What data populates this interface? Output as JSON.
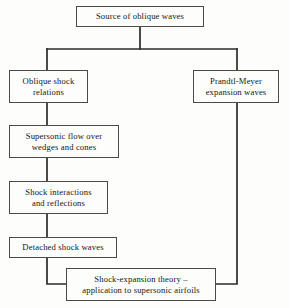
{
  "diagram": {
    "line_color": "#2b2b2b",
    "box_border_color": "#4a4a4a",
    "background_color": "#fdfdfc",
    "text_color": "#151515"
  },
  "nodes": {
    "source": {
      "label": "Source of oblique waves"
    },
    "oblique_shock": {
      "label": "Oblique shock\nrelations"
    },
    "prandtl_meyer": {
      "label": "Prandtl-Meyer\nexpansion waves"
    },
    "supersonic_wedges": {
      "label": "Supersonic flow over\nwedges and cones"
    },
    "shock_interactions": {
      "label": "Shock interactions\nand reflections"
    },
    "detached_shock": {
      "label": "Detached shock waves"
    },
    "shock_expansion": {
      "label": "Shock-expansion theory –\napplication to supersonic airfoils"
    }
  },
  "connectors": [
    {
      "name": "source-to-split",
      "from": "source",
      "to": "split-bar"
    },
    {
      "name": "split-bar-to-oblique-shock",
      "from": "split-bar",
      "to": "oblique_shock"
    },
    {
      "name": "split-bar-to-prandtl-meyer",
      "from": "split-bar",
      "to": "prandtl_meyer"
    },
    {
      "name": "oblique-shock-to-supersonic-wedges",
      "from": "oblique_shock",
      "to": "supersonic_wedges"
    },
    {
      "name": "supersonic-wedges-to-shock-interactions",
      "from": "supersonic_wedges",
      "to": "shock_interactions"
    },
    {
      "name": "shock-interactions-to-detached-shock",
      "from": "shock_interactions",
      "to": "detached_shock"
    },
    {
      "name": "detached-shock-to-shock-expansion",
      "from": "detached_shock",
      "to": "shock_expansion"
    },
    {
      "name": "prandtl-meyer-to-shock-expansion",
      "from": "prandtl_meyer",
      "to": "shock_expansion"
    }
  ]
}
